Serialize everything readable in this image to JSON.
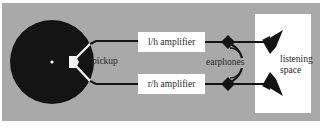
{
  "diagram": {
    "panel_color": "#a9a9a9",
    "record_color": "#141414",
    "line_color": "#141414",
    "box_color": "#ffffff",
    "labels": {
      "pickup": "pickup",
      "left_amplifier": "l/h amplifier",
      "right_amplifier": "r/h amplifier",
      "earphones": "earphones",
      "listening_space_line1": "listening",
      "listening_space_line2": "space"
    },
    "components": [
      {
        "id": "record",
        "icon": "record-disc"
      },
      {
        "id": "pickup",
        "icon": "pickup-stylus"
      },
      {
        "id": "left_amplifier",
        "icon": "box"
      },
      {
        "id": "right_amplifier",
        "icon": "box"
      },
      {
        "id": "left_earphone_connector",
        "icon": "diamond"
      },
      {
        "id": "right_earphone_connector",
        "icon": "diamond"
      },
      {
        "id": "earphones_headband",
        "icon": "arc"
      },
      {
        "id": "left_speaker",
        "icon": "speaker-triangle"
      },
      {
        "id": "right_speaker",
        "icon": "speaker-triangle"
      },
      {
        "id": "listening_space",
        "icon": "box"
      }
    ]
  }
}
